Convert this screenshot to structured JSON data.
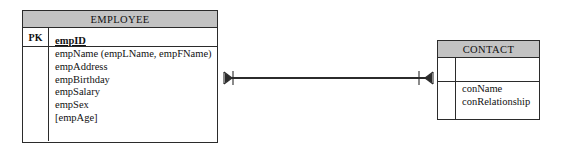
{
  "diagram": {
    "type": "entity-relationship-diagram",
    "notation": "crow's-foot",
    "background_color": "#ffffff",
    "header_fill_color": "#c3c3c3",
    "line_color": "#2b2b2b"
  },
  "entities": [
    {
      "name": "EMPLOYEE",
      "title": "EMPLOYEE",
      "key_label": "PK",
      "primary_key": "empID",
      "attributes": [
        "empName (empLName, empFName)",
        "empAddress",
        "empBirthday",
        "empSalary",
        "empSex",
        "[empAge]"
      ]
    },
    {
      "name": "CONTACT",
      "title": "CONTACT",
      "key_label": "",
      "primary_key": "",
      "attributes": [
        "conName",
        "conRelationship"
      ]
    }
  ],
  "relationship": {
    "name": "employee-contact-relationship",
    "left_entity": "EMPLOYEE",
    "right_entity": "CONTACT",
    "left_cardinality": "one-and-only-one-to-many",
    "right_cardinality": "one-to-many",
    "left_symbol": "crows-foot-with-one-tick",
    "right_symbol": "one-tick-with-crows-foot"
  }
}
